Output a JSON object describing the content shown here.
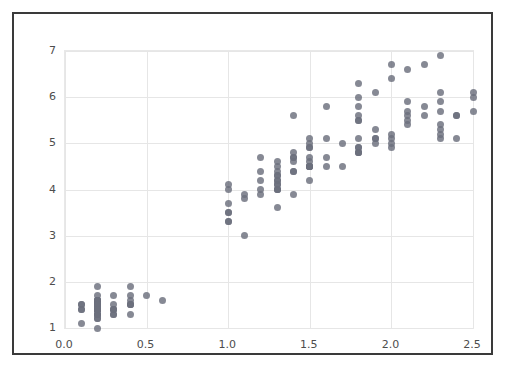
{
  "figure": {
    "background_color": "#ffffff",
    "frame_color": "#3a3a3a",
    "plot_background": "#ffffff",
    "grid_color": "#e6e6e6",
    "tick_color": "#4d4d4d"
  },
  "chart_data": {
    "type": "scatter",
    "title": "",
    "subtitle": "",
    "xlabel": "",
    "ylabel": "",
    "xlim": [
      0.0,
      2.5
    ],
    "ylim": [
      1.0,
      7.0
    ],
    "xticks": [
      0.0,
      0.5,
      1.0,
      1.5,
      2.0,
      2.5
    ],
    "xtick_labels": [
      "0.0",
      "0.5",
      "1.0",
      "1.5",
      "2.0",
      "2.5"
    ],
    "yticks": [
      1,
      2,
      3,
      4,
      5,
      6,
      7
    ],
    "ytick_labels": [
      "1",
      "2",
      "3",
      "4",
      "5",
      "6",
      "7"
    ],
    "grid": true,
    "legend": "none",
    "marker": {
      "shape": "circle",
      "color": "#6b6f7d",
      "size_px": 7,
      "opacity": 0.82
    },
    "series": [
      {
        "name": "observations",
        "points": [
          [
            0.2,
            1.4
          ],
          [
            0.2,
            1.4
          ],
          [
            0.2,
            1.3
          ],
          [
            0.2,
            1.5
          ],
          [
            0.2,
            1.4
          ],
          [
            0.4,
            1.7
          ],
          [
            0.3,
            1.4
          ],
          [
            0.2,
            1.5
          ],
          [
            0.2,
            1.4
          ],
          [
            0.1,
            1.5
          ],
          [
            0.2,
            1.5
          ],
          [
            0.2,
            1.6
          ],
          [
            0.1,
            1.4
          ],
          [
            0.1,
            1.1
          ],
          [
            0.2,
            1.2
          ],
          [
            0.4,
            1.5
          ],
          [
            0.4,
            1.3
          ],
          [
            0.3,
            1.4
          ],
          [
            0.3,
            1.7
          ],
          [
            0.3,
            1.5
          ],
          [
            0.2,
            1.7
          ],
          [
            0.4,
            1.5
          ],
          [
            0.2,
            1.0
          ],
          [
            0.5,
            1.7
          ],
          [
            0.2,
            1.9
          ],
          [
            0.2,
            1.6
          ],
          [
            0.4,
            1.6
          ],
          [
            0.2,
            1.5
          ],
          [
            0.2,
            1.4
          ],
          [
            0.2,
            1.6
          ],
          [
            0.2,
            1.6
          ],
          [
            0.4,
            1.5
          ],
          [
            0.1,
            1.5
          ],
          [
            0.2,
            1.4
          ],
          [
            0.2,
            1.5
          ],
          [
            0.2,
            1.2
          ],
          [
            0.2,
            1.3
          ],
          [
            0.1,
            1.4
          ],
          [
            0.2,
            1.3
          ],
          [
            0.2,
            1.5
          ],
          [
            0.3,
            1.3
          ],
          [
            0.3,
            1.3
          ],
          [
            0.2,
            1.3
          ],
          [
            0.6,
            1.6
          ],
          [
            0.4,
            1.9
          ],
          [
            0.3,
            1.4
          ],
          [
            0.2,
            1.6
          ],
          [
            0.2,
            1.4
          ],
          [
            0.2,
            1.5
          ],
          [
            0.2,
            1.4
          ],
          [
            1.4,
            4.7
          ],
          [
            1.5,
            4.5
          ],
          [
            1.5,
            4.9
          ],
          [
            1.3,
            4.0
          ],
          [
            1.5,
            4.6
          ],
          [
            1.3,
            4.5
          ],
          [
            1.6,
            4.7
          ],
          [
            1.0,
            3.3
          ],
          [
            1.3,
            4.6
          ],
          [
            1.4,
            3.9
          ],
          [
            1.0,
            3.5
          ],
          [
            1.5,
            4.2
          ],
          [
            1.0,
            4.0
          ],
          [
            1.4,
            4.7
          ],
          [
            1.3,
            3.6
          ],
          [
            1.4,
            4.4
          ],
          [
            1.5,
            4.5
          ],
          [
            1.0,
            4.1
          ],
          [
            1.5,
            4.5
          ],
          [
            1.1,
            3.9
          ],
          [
            1.8,
            4.8
          ],
          [
            1.3,
            4.0
          ],
          [
            1.5,
            4.9
          ],
          [
            1.2,
            4.7
          ],
          [
            1.3,
            4.3
          ],
          [
            1.4,
            4.4
          ],
          [
            1.4,
            4.8
          ],
          [
            1.7,
            5.0
          ],
          [
            1.5,
            4.5
          ],
          [
            1.0,
            3.5
          ],
          [
            1.1,
            3.8
          ],
          [
            1.0,
            3.7
          ],
          [
            1.2,
            3.9
          ],
          [
            1.6,
            5.1
          ],
          [
            1.5,
            4.5
          ],
          [
            1.6,
            4.5
          ],
          [
            1.5,
            4.7
          ],
          [
            1.3,
            4.4
          ],
          [
            1.3,
            4.1
          ],
          [
            1.3,
            4.0
          ],
          [
            1.2,
            4.4
          ],
          [
            1.4,
            4.6
          ],
          [
            1.2,
            4.0
          ],
          [
            1.0,
            3.3
          ],
          [
            1.3,
            4.2
          ],
          [
            1.2,
            4.2
          ],
          [
            1.3,
            4.2
          ],
          [
            1.3,
            4.3
          ],
          [
            1.1,
            3.0
          ],
          [
            1.3,
            4.1
          ],
          [
            2.5,
            6.0
          ],
          [
            1.9,
            5.1
          ],
          [
            2.1,
            5.9
          ],
          [
            1.8,
            5.6
          ],
          [
            2.2,
            5.8
          ],
          [
            2.1,
            6.6
          ],
          [
            1.7,
            4.5
          ],
          [
            1.8,
            6.3
          ],
          [
            1.8,
            5.8
          ],
          [
            2.5,
            6.1
          ],
          [
            2.0,
            5.1
          ],
          [
            1.9,
            5.3
          ],
          [
            2.1,
            5.5
          ],
          [
            2.0,
            5.0
          ],
          [
            2.4,
            5.1
          ],
          [
            2.3,
            5.3
          ],
          [
            1.8,
            5.5
          ],
          [
            2.2,
            6.7
          ],
          [
            2.3,
            6.9
          ],
          [
            1.5,
            5.0
          ],
          [
            2.3,
            5.7
          ],
          [
            2.0,
            4.9
          ],
          [
            2.0,
            6.7
          ],
          [
            1.8,
            4.9
          ],
          [
            2.1,
            5.7
          ],
          [
            1.8,
            6.0
          ],
          [
            1.8,
            4.8
          ],
          [
            1.8,
            4.9
          ],
          [
            2.1,
            5.6
          ],
          [
            1.6,
            5.8
          ],
          [
            1.9,
            6.1
          ],
          [
            2.0,
            6.4
          ],
          [
            2.2,
            5.6
          ],
          [
            1.5,
            5.1
          ],
          [
            1.4,
            5.6
          ],
          [
            2.3,
            6.1
          ],
          [
            2.4,
            5.6
          ],
          [
            1.8,
            5.5
          ],
          [
            1.8,
            4.8
          ],
          [
            2.1,
            5.4
          ],
          [
            2.4,
            5.6
          ],
          [
            2.3,
            5.1
          ],
          [
            1.9,
            5.1
          ],
          [
            2.3,
            5.9
          ],
          [
            2.5,
            5.7
          ],
          [
            2.3,
            5.2
          ],
          [
            1.9,
            5.0
          ],
          [
            2.0,
            5.2
          ],
          [
            2.3,
            5.4
          ],
          [
            1.8,
            5.1
          ]
        ]
      }
    ]
  }
}
